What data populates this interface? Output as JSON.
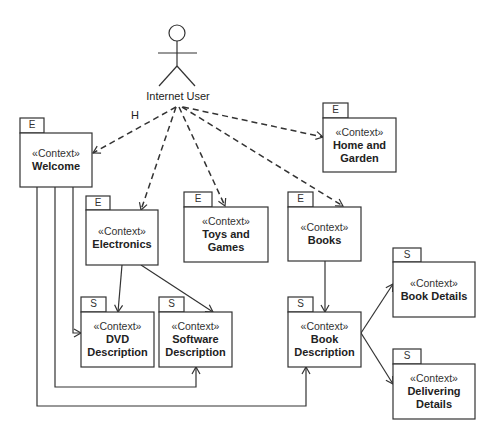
{
  "diagram": {
    "actor": {
      "label": "Internet User",
      "icon": "stick-figure-actor"
    },
    "edge_label": "H",
    "nodes": [
      {
        "id": "welcome",
        "tag": "E",
        "stereotype": "«Context»",
        "name_lines": [
          "Welcome"
        ]
      },
      {
        "id": "home_garden",
        "tag": "E",
        "stereotype": "«Context»",
        "name_lines": [
          "Home and",
          "Garden"
        ]
      },
      {
        "id": "electronics",
        "tag": "E",
        "stereotype": "«Context»",
        "name_lines": [
          "Electronics"
        ]
      },
      {
        "id": "toys_games",
        "tag": "E",
        "stereotype": "«Context»",
        "name_lines": [
          "Toys and",
          "Games"
        ]
      },
      {
        "id": "books",
        "tag": "E",
        "stereotype": "«Context»",
        "name_lines": [
          "Books"
        ]
      },
      {
        "id": "dvd_description",
        "tag": "S",
        "stereotype": "«Context»",
        "name_lines": [
          "DVD",
          "Description"
        ]
      },
      {
        "id": "software_description",
        "tag": "S",
        "stereotype": "«Context»",
        "name_lines": [
          "Software",
          "Description"
        ]
      },
      {
        "id": "book_description",
        "tag": "S",
        "stereotype": "«Context»",
        "name_lines": [
          "Book",
          "Description"
        ]
      },
      {
        "id": "book_details",
        "tag": "S",
        "stereotype": "«Context»",
        "name_lines": [
          "Book Details"
        ]
      },
      {
        "id": "delivering_details",
        "tag": "S",
        "stereotype": "«Context»",
        "name_lines": [
          "Delivering",
          "Details"
        ]
      }
    ],
    "edges": [
      {
        "from": "actor",
        "to": "welcome",
        "style": "dashed",
        "label": "H"
      },
      {
        "from": "actor",
        "to": "electronics",
        "style": "dashed"
      },
      {
        "from": "actor",
        "to": "toys_games",
        "style": "dashed"
      },
      {
        "from": "actor",
        "to": "books",
        "style": "dashed"
      },
      {
        "from": "actor",
        "to": "home_garden",
        "style": "dashed"
      },
      {
        "from": "electronics",
        "to": "dvd_description",
        "style": "solid"
      },
      {
        "from": "electronics",
        "to": "software_description",
        "style": "solid"
      },
      {
        "from": "books",
        "to": "book_description",
        "style": "solid"
      },
      {
        "from": "book_description",
        "to": "book_details",
        "style": "solid"
      },
      {
        "from": "book_description",
        "to": "delivering_details",
        "style": "solid"
      },
      {
        "from": "welcome",
        "to": "dvd_description",
        "style": "solid"
      },
      {
        "from": "welcome",
        "to": "software_description",
        "style": "solid"
      },
      {
        "from": "welcome",
        "to": "book_description",
        "style": "solid"
      }
    ],
    "colors": {
      "stroke": "#333333",
      "text": "#222222",
      "background": "#ffffff"
    }
  }
}
